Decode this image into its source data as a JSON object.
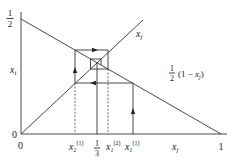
{
  "diagram": {
    "type": "cobweb",
    "axes": {
      "x_label": "x_j",
      "y_label": "x_i",
      "x_origin_label": "0",
      "y_origin_label": "0",
      "y_max_label_num": "1",
      "y_max_label_den": "2",
      "x_max_label": "1"
    },
    "curves": [
      {
        "name": "identity",
        "label": "x_j",
        "equation": "x_i = x_j"
      },
      {
        "name": "response",
        "label_num": "1",
        "label_den": "2",
        "label_expr": "(1 − x_j)",
        "equation": "x_i = 1/2 (1 − x_j)"
      }
    ],
    "x_ticks": [
      {
        "label": "x",
        "sub": "2",
        "sup": "(1)",
        "style": "dashed"
      },
      {
        "label_num": "1",
        "label_den": "3",
        "style": "solid"
      },
      {
        "label": "x",
        "sub": "1",
        "sup": "(2)",
        "style": "dashed"
      },
      {
        "label": "x",
        "sub": "1",
        "sup": "(1)",
        "style": "solid"
      }
    ],
    "fixed_point": "1/3",
    "colors": {
      "ink": "#222222",
      "background": "#ffffff"
    }
  }
}
